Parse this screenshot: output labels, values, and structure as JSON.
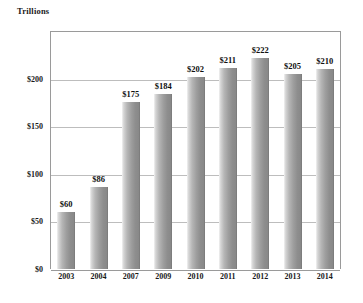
{
  "chart_data": {
    "type": "bar",
    "title": "Trillions",
    "xlabel": "",
    "ylabel": "",
    "categories": [
      "2003",
      "2004",
      "2007",
      "2009",
      "2010",
      "2011",
      "2012",
      "2013",
      "2014"
    ],
    "values": [
      60,
      86,
      175,
      184,
      202,
      211,
      222,
      205,
      210
    ],
    "data_labels": [
      "$60",
      "$86",
      "$175",
      "$184",
      "$202",
      "$211",
      "$222",
      "$205",
      "$210"
    ],
    "ylim": [
      0,
      250
    ],
    "y_ticks": [
      0,
      50,
      100,
      150,
      200
    ],
    "y_tick_labels": [
      "$0",
      "$50",
      "$100",
      "$150",
      "$200"
    ],
    "grid": true,
    "legend": false,
    "legend_position": "none",
    "bar_color": "#9e9e9e",
    "gridline_color": "#bdbdbd",
    "axis_color": "#9a9a9a",
    "text_color": "#1a1a1a"
  }
}
